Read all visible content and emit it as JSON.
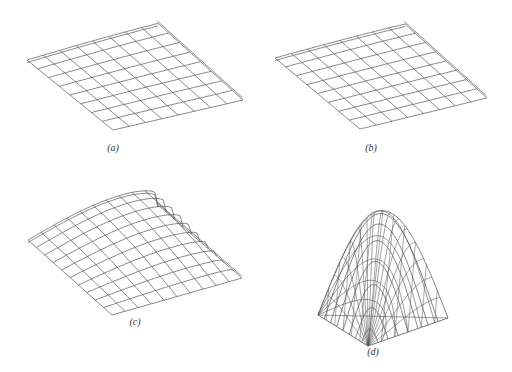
{
  "figure": {
    "panels": [
      {
        "id": "a",
        "caption": "(a)",
        "description": "nearly flat, slightly curved rectangular wireframe surface",
        "grid_lines": 9
      },
      {
        "id": "b",
        "caption": "(b)",
        "description": "nearly flat, slightly curved rectangular wireframe surface",
        "grid_lines": 9
      },
      {
        "id": "c",
        "caption": "(c)",
        "description": "dome/pillow-shaped wireframe surface",
        "grid_lines": 11
      },
      {
        "id": "d",
        "caption": "(d)",
        "description": "tall peaked wireframe surface over triangular base",
        "grid_lines": 9
      }
    ],
    "line_color": "#555555"
  }
}
